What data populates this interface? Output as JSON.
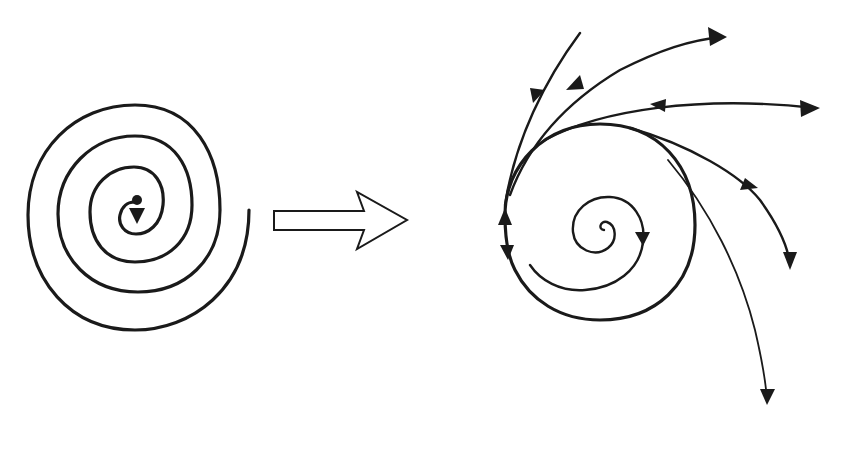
{
  "diagram": {
    "colors": {
      "stroke": "#1a1a1a",
      "background": "#ffffff"
    },
    "left_figure": {
      "name": "spiral",
      "center": [
        135,
        210
      ],
      "turns": 3.5,
      "center_marker": "dot-with-down-arrow"
    },
    "connector": {
      "name": "hollow-right-arrow",
      "direction": "right"
    },
    "right_figure": {
      "name": "limit-cycle",
      "cycle_center": [
        600,
        235
      ],
      "cycle_radius": 95,
      "inner_spiral": true,
      "trajectory_count": 10,
      "arrowheads": "bidirectional on outer trajectories"
    }
  }
}
